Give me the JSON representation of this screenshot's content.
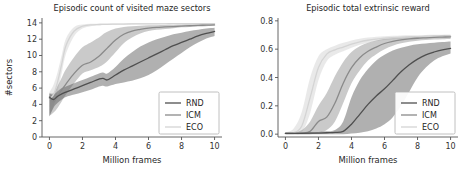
{
  "figure": {
    "width": 472,
    "height": 174,
    "background": "#ffffff"
  },
  "colors": {
    "rnd": "#4f4f4f",
    "icm": "#8a8a8a",
    "eco": "#d4d4d4",
    "rnd_band": "#6e6e6e",
    "icm_band": "#a8a8a8",
    "eco_band": "#e4e4e4",
    "axis": "#555555",
    "text": "#262626"
  },
  "chart_data": [
    {
      "id": "maze-sectors",
      "type": "line",
      "title": "Episodic count of visited maze sectors",
      "xlabel": "Million frames",
      "ylabel": "#sectors",
      "xlim": [
        -0.45,
        10.45
      ],
      "ylim": [
        0,
        14.6
      ],
      "xticks": [
        0,
        2,
        4,
        6,
        8,
        10
      ],
      "xticklabels": [
        "0",
        "2",
        "4",
        "6",
        "8",
        "10"
      ],
      "yticks": [
        0,
        2,
        4,
        6,
        8,
        10,
        12,
        14
      ],
      "yticklabels": [
        "0",
        "2",
        "4",
        "6",
        "8",
        "10",
        "12",
        "14"
      ],
      "grid": false,
      "legend_position": "lower right",
      "x": [
        0,
        0.25,
        0.5,
        0.75,
        1,
        1.5,
        2,
        2.5,
        3,
        3.25,
        3.5,
        4,
        4.5,
        5,
        5.5,
        6,
        6.5,
        7,
        7.5,
        8,
        8.5,
        9,
        9.5,
        10
      ],
      "series": [
        {
          "name": "RND",
          "color": "#4f4f4f",
          "values": [
            4.9,
            4.6,
            5.0,
            5.3,
            5.5,
            5.9,
            6.3,
            6.7,
            7.1,
            7.2,
            7.0,
            7.6,
            8.2,
            8.7,
            9.2,
            9.7,
            10.2,
            10.7,
            11.2,
            11.6,
            12.0,
            12.4,
            12.7,
            12.95
          ],
          "lower": [
            2.5,
            3.6,
            4.2,
            4.6,
            4.9,
            5.2,
            5.5,
            5.8,
            6.2,
            6.3,
            6.2,
            6.5,
            6.7,
            6.9,
            7.2,
            7.6,
            8.2,
            8.9,
            9.6,
            10.3,
            11.0,
            11.6,
            12.1,
            12.4
          ],
          "upper": [
            5.3,
            5.2,
            5.6,
            6.0,
            6.2,
            6.6,
            7.0,
            7.4,
            7.8,
            7.9,
            7.8,
            8.6,
            9.6,
            10.4,
            11.1,
            11.6,
            12.0,
            12.3,
            12.6,
            12.8,
            13.0,
            13.15,
            13.3,
            13.4
          ]
        },
        {
          "name": "ICM",
          "color": "#8a8a8a",
          "values": [
            4.8,
            4.3,
            5.0,
            5.8,
            6.5,
            7.8,
            8.8,
            9.2,
            9.9,
            10.4,
            10.9,
            11.9,
            12.6,
            13.0,
            13.2,
            13.35,
            13.45,
            13.5,
            13.55,
            13.6,
            13.65,
            13.7,
            13.72,
            13.75
          ],
          "lower": [
            2.6,
            3.0,
            3.6,
            4.4,
            5.2,
            6.6,
            7.8,
            8.2,
            8.6,
            8.9,
            9.3,
            10.4,
            11.5,
            12.2,
            12.7,
            13.0,
            13.15,
            13.25,
            13.35,
            13.45,
            13.5,
            13.55,
            13.6,
            13.65
          ],
          "upper": [
            5.4,
            5.4,
            6.3,
            7.3,
            8.3,
            9.8,
            11.0,
            11.6,
            12.2,
            12.6,
            12.9,
            13.3,
            13.5,
            13.6,
            13.65,
            13.7,
            13.72,
            13.75,
            13.78,
            13.8,
            13.82,
            13.84,
            13.86,
            13.88
          ]
        },
        {
          "name": "ECO",
          "color": "#d4d4d4",
          "values": [
            4.7,
            5.2,
            6.8,
            9.0,
            11.2,
            13.0,
            13.6,
            13.75,
            13.8,
            13.82,
            13.83,
            13.85,
            13.86,
            13.87,
            13.88,
            13.88,
            13.89,
            13.89,
            13.9,
            13.9,
            13.9,
            13.9,
            13.9,
            13.9
          ],
          "lower": [
            2.7,
            3.8,
            5.6,
            7.9,
            10.2,
            12.4,
            13.3,
            13.6,
            13.7,
            13.73,
            13.75,
            13.78,
            13.8,
            13.81,
            13.82,
            13.83,
            13.84,
            13.85,
            13.85,
            13.86,
            13.86,
            13.86,
            13.86,
            13.86
          ],
          "upper": [
            5.5,
            6.4,
            8.0,
            10.1,
            12.1,
            13.5,
            13.8,
            13.88,
            13.9,
            13.92,
            13.93,
            13.94,
            13.94,
            13.95,
            13.95,
            13.95,
            13.95,
            13.95,
            13.96,
            13.96,
            13.96,
            13.96,
            13.96,
            13.96
          ]
        }
      ]
    },
    {
      "id": "extrinsic-reward",
      "type": "line",
      "title": "Episodic total extrinsic reward",
      "xlabel": "Million frames",
      "ylabel": "",
      "xlim": [
        -0.45,
        10.45
      ],
      "ylim": [
        -0.02,
        0.82
      ],
      "xticks": [
        0,
        2,
        4,
        6,
        8,
        10
      ],
      "xticklabels": [
        "0",
        "2",
        "4",
        "6",
        "8",
        "10"
      ],
      "yticks": [
        0.0,
        0.2,
        0.4,
        0.6,
        0.8
      ],
      "yticklabels": [
        "0.0",
        "0.2",
        "0.4",
        "0.6",
        "0.8"
      ],
      "grid": false,
      "legend_position": "lower right",
      "x": [
        0,
        0.5,
        1,
        1.5,
        2,
        2.5,
        3,
        3.5,
        4,
        4.5,
        5,
        5.5,
        6,
        6.5,
        7,
        7.5,
        8,
        8.5,
        9,
        9.5,
        10
      ],
      "series": [
        {
          "name": "RND",
          "color": "#4f4f4f",
          "values": [
            0.005,
            0.005,
            0.006,
            0.007,
            0.008,
            0.01,
            0.012,
            0.02,
            0.07,
            0.14,
            0.21,
            0.27,
            0.32,
            0.38,
            0.44,
            0.49,
            0.53,
            0.56,
            0.58,
            0.595,
            0.605
          ],
          "lower": [
            0.0,
            0.0,
            0.0,
            0.0,
            0.0,
            0.0,
            0.0,
            0.0,
            0.005,
            0.01,
            0.02,
            0.04,
            0.07,
            0.12,
            0.2,
            0.3,
            0.4,
            0.47,
            0.52,
            0.55,
            0.57
          ],
          "upper": [
            0.01,
            0.01,
            0.012,
            0.014,
            0.016,
            0.02,
            0.03,
            0.09,
            0.26,
            0.38,
            0.46,
            0.52,
            0.56,
            0.59,
            0.61,
            0.625,
            0.635,
            0.64,
            0.645,
            0.65,
            0.655
          ]
        },
        {
          "name": "ICM",
          "color": "#8a8a8a",
          "values": [
            0.005,
            0.006,
            0.008,
            0.02,
            0.09,
            0.12,
            0.22,
            0.36,
            0.47,
            0.54,
            0.585,
            0.615,
            0.64,
            0.655,
            0.665,
            0.672,
            0.677,
            0.68,
            0.683,
            0.685,
            0.687
          ],
          "lower": [
            0.0,
            0.0,
            0.0,
            0.0,
            0.01,
            0.03,
            0.09,
            0.22,
            0.36,
            0.45,
            0.52,
            0.565,
            0.6,
            0.625,
            0.642,
            0.652,
            0.66,
            0.665,
            0.668,
            0.67,
            0.672
          ],
          "upper": [
            0.012,
            0.014,
            0.03,
            0.09,
            0.2,
            0.29,
            0.41,
            0.51,
            0.58,
            0.62,
            0.645,
            0.662,
            0.673,
            0.68,
            0.686,
            0.69,
            0.693,
            0.695,
            0.697,
            0.699,
            0.7
          ]
        },
        {
          "name": "ECO",
          "color": "#d4d4d4",
          "values": [
            0.005,
            0.01,
            0.06,
            0.26,
            0.47,
            0.565,
            0.595,
            0.615,
            0.635,
            0.652,
            0.663,
            0.671,
            0.677,
            0.681,
            0.684,
            0.686,
            0.688,
            0.689,
            0.69,
            0.691,
            0.692
          ],
          "lower": [
            0.0,
            0.0,
            0.015,
            0.15,
            0.38,
            0.515,
            0.56,
            0.585,
            0.61,
            0.632,
            0.646,
            0.657,
            0.664,
            0.67,
            0.674,
            0.677,
            0.679,
            0.681,
            0.682,
            0.683,
            0.684
          ],
          "upper": [
            0.012,
            0.04,
            0.16,
            0.4,
            0.55,
            0.6,
            0.625,
            0.645,
            0.662,
            0.674,
            0.682,
            0.688,
            0.692,
            0.695,
            0.697,
            0.698,
            0.699,
            0.7,
            0.701,
            0.702,
            0.703
          ]
        }
      ]
    }
  ]
}
